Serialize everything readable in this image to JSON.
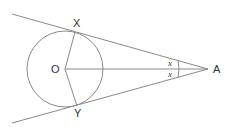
{
  "diagram": {
    "type": "geometry",
    "labels": {
      "center": "O",
      "tangent_point_top": "X",
      "tangent_point_bottom": "Y",
      "external_point": "A",
      "angle_top": "x",
      "angle_bottom": "x"
    },
    "colors": {
      "line": "#8a8a8a",
      "text": "#333333",
      "background": "#ffffff"
    }
  }
}
